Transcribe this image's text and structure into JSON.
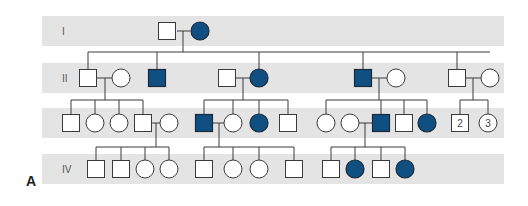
{
  "figure": {
    "panel_label": "A",
    "colors": {
      "affected": "#0f4f82",
      "band": "#e4e4e4",
      "line": "#3a3a3a"
    }
  },
  "generations": [
    {
      "label": "I",
      "band": [
        42,
        16,
        462,
        30
      ]
    },
    {
      "label": "II",
      "band": [
        42,
        63,
        462,
        30
      ]
    },
    {
      "label": "III",
      "band": [
        42,
        108,
        462,
        30
      ]
    },
    {
      "label": "IV",
      "band": [
        42,
        154,
        462,
        30
      ]
    }
  ],
  "individuals": [
    {
      "id": "I-1",
      "sex": "M",
      "affected": false,
      "x": 167,
      "y": 31
    },
    {
      "id": "I-2",
      "sex": "F",
      "affected": true,
      "x": 200,
      "y": 31
    },
    {
      "id": "II-1",
      "sex": "M",
      "affected": false,
      "x": 88,
      "y": 78
    },
    {
      "id": "II-2",
      "sex": "F",
      "affected": false,
      "x": 121,
      "y": 78
    },
    {
      "id": "II-3",
      "sex": "M",
      "affected": true,
      "x": 157,
      "y": 78
    },
    {
      "id": "II-4",
      "sex": "M",
      "affected": false,
      "x": 227,
      "y": 78
    },
    {
      "id": "II-5",
      "sex": "F",
      "affected": true,
      "x": 259,
      "y": 78
    },
    {
      "id": "II-6",
      "sex": "M",
      "affected": true,
      "x": 363,
      "y": 78
    },
    {
      "id": "II-7",
      "sex": "F",
      "affected": false,
      "x": 396,
      "y": 78
    },
    {
      "id": "II-8",
      "sex": "M",
      "affected": false,
      "x": 457,
      "y": 78
    },
    {
      "id": "II-9",
      "sex": "F",
      "affected": false,
      "x": 490,
      "y": 78
    },
    {
      "id": "III-1",
      "sex": "M",
      "affected": false,
      "x": 71,
      "y": 123
    },
    {
      "id": "III-2",
      "sex": "F",
      "affected": false,
      "x": 95,
      "y": 123
    },
    {
      "id": "III-3",
      "sex": "F",
      "affected": false,
      "x": 119,
      "y": 123
    },
    {
      "id": "III-4",
      "sex": "M",
      "affected": false,
      "x": 143,
      "y": 123
    },
    {
      "id": "III-5",
      "sex": "F",
      "affected": false,
      "x": 169,
      "y": 123
    },
    {
      "id": "III-6",
      "sex": "M",
      "affected": true,
      "x": 204,
      "y": 123
    },
    {
      "id": "III-7",
      "sex": "F",
      "affected": false,
      "x": 233,
      "y": 123
    },
    {
      "id": "III-8",
      "sex": "F",
      "affected": true,
      "x": 259,
      "y": 123
    },
    {
      "id": "III-9",
      "sex": "M",
      "affected": false,
      "x": 288,
      "y": 123
    },
    {
      "id": "III-10",
      "sex": "F",
      "affected": false,
      "x": 326,
      "y": 123
    },
    {
      "id": "III-11",
      "sex": "F",
      "affected": false,
      "x": 350,
      "y": 123
    },
    {
      "id": "III-12",
      "sex": "M",
      "affected": true,
      "x": 381,
      "y": 123
    },
    {
      "id": "III-13",
      "sex": "M",
      "affected": false,
      "x": 404,
      "y": 123
    },
    {
      "id": "III-14",
      "sex": "F",
      "affected": true,
      "x": 427,
      "y": 123
    },
    {
      "id": "III-15",
      "sex": "M",
      "affected": false,
      "x": 460,
      "y": 123,
      "count": "2"
    },
    {
      "id": "III-16",
      "sex": "F",
      "affected": false,
      "x": 488,
      "y": 123,
      "count": "3"
    },
    {
      "id": "IV-1",
      "sex": "M",
      "affected": false,
      "x": 96,
      "y": 169
    },
    {
      "id": "IV-2",
      "sex": "M",
      "affected": false,
      "x": 121,
      "y": 169
    },
    {
      "id": "IV-3",
      "sex": "F",
      "affected": false,
      "x": 145,
      "y": 169
    },
    {
      "id": "IV-4",
      "sex": "F",
      "affected": false,
      "x": 169,
      "y": 169
    },
    {
      "id": "IV-5",
      "sex": "M",
      "affected": false,
      "x": 204,
      "y": 169
    },
    {
      "id": "IV-6",
      "sex": "F",
      "affected": false,
      "x": 233,
      "y": 169
    },
    {
      "id": "IV-7",
      "sex": "F",
      "affected": false,
      "x": 259,
      "y": 169
    },
    {
      "id": "IV-8",
      "sex": "M",
      "affected": false,
      "x": 294,
      "y": 169
    },
    {
      "id": "IV-9",
      "sex": "M",
      "affected": false,
      "x": 331,
      "y": 169
    },
    {
      "id": "IV-10",
      "sex": "F",
      "affected": true,
      "x": 355,
      "y": 169
    },
    {
      "id": "IV-11",
      "sex": "M",
      "affected": false,
      "x": 381,
      "y": 169
    },
    {
      "id": "IV-12",
      "sex": "F",
      "affected": true,
      "x": 405,
      "y": 169
    }
  ],
  "lines": [
    [
      177,
      31,
      190,
      31
    ],
    [
      183,
      31,
      183,
      52
    ],
    [
      88,
      52,
      490,
      52
    ],
    [
      88,
      52,
      88,
      70
    ],
    [
      157,
      52,
      157,
      70
    ],
    [
      259,
      52,
      259,
      70
    ],
    [
      363,
      52,
      363,
      70
    ],
    [
      457,
      52,
      457,
      70
    ],
    [
      97,
      78,
      112,
      78
    ],
    [
      105,
      78,
      105,
      100
    ],
    [
      71,
      100,
      143,
      100
    ],
    [
      71,
      100,
      71,
      115
    ],
    [
      95,
      100,
      95,
      115
    ],
    [
      119,
      100,
      119,
      115
    ],
    [
      143,
      100,
      143,
      115
    ],
    [
      236,
      78,
      250,
      78
    ],
    [
      243,
      78,
      243,
      100
    ],
    [
      204,
      100,
      288,
      100
    ],
    [
      204,
      100,
      204,
      115
    ],
    [
      233,
      100,
      233,
      115
    ],
    [
      259,
      100,
      259,
      115
    ],
    [
      288,
      100,
      288,
      115
    ],
    [
      372,
      78,
      387,
      78
    ],
    [
      379,
      78,
      379,
      100
    ],
    [
      326,
      100,
      427,
      100
    ],
    [
      326,
      100,
      326,
      115
    ],
    [
      381,
      100,
      381,
      115
    ],
    [
      404,
      100,
      404,
      115
    ],
    [
      427,
      100,
      427,
      115
    ],
    [
      466,
      78,
      481,
      78
    ],
    [
      473,
      78,
      473,
      100
    ],
    [
      460,
      100,
      488,
      100
    ],
    [
      460,
      100,
      460,
      115
    ],
    [
      488,
      100,
      488,
      115
    ],
    [
      152,
      123,
      160,
      123
    ],
    [
      156,
      123,
      156,
      147
    ],
    [
      96,
      147,
      169,
      147
    ],
    [
      96,
      147,
      96,
      161
    ],
    [
      121,
      147,
      121,
      161
    ],
    [
      145,
      147,
      145,
      161
    ],
    [
      169,
      147,
      169,
      161
    ],
    [
      213,
      123,
      224,
      123
    ],
    [
      219,
      123,
      219,
      147
    ],
    [
      204,
      147,
      294,
      147
    ],
    [
      204,
      147,
      204,
      161
    ],
    [
      233,
      147,
      233,
      161
    ],
    [
      259,
      147,
      259,
      161
    ],
    [
      294,
      147,
      294,
      161
    ],
    [
      359,
      123,
      372,
      123
    ],
    [
      365,
      123,
      365,
      147
    ],
    [
      331,
      147,
      405,
      147
    ],
    [
      331,
      147,
      331,
      161
    ],
    [
      355,
      147,
      355,
      161
    ],
    [
      381,
      147,
      381,
      161
    ],
    [
      405,
      147,
      405,
      161
    ]
  ]
}
